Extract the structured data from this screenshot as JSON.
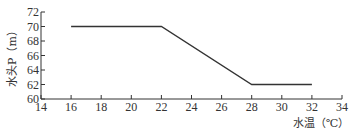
{
  "chart_data": {
    "type": "line",
    "title": "",
    "xlabel": "水温（℃）",
    "ylabel": "水头P（m）",
    "xlim": [
      14,
      34
    ],
    "ylim": [
      60,
      72
    ],
    "xticks": [
      14,
      16,
      18,
      20,
      22,
      24,
      26,
      28,
      30,
      32,
      34
    ],
    "yticks": [
      60,
      62,
      64,
      66,
      68,
      70,
      72
    ],
    "grid": false,
    "legend": null,
    "series": [
      {
        "name": "水头",
        "x": [
          16,
          22,
          28,
          32
        ],
        "y": [
          70,
          70,
          62,
          62
        ],
        "color": "#333333"
      }
    ]
  },
  "colors": {
    "axis": "#333333",
    "line": "#333333",
    "background": "#ffffff"
  }
}
